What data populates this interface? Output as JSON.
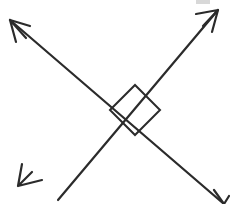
{
  "figure": {
    "title": "Two intersecting perpendicular lines with right angle marker",
    "canvas": {
      "width": 230,
      "height": 204,
      "background": "#ffffff"
    },
    "style": {
      "stroke_color": "#2b2b2b",
      "stroke_width": 2.2,
      "marker_stroke_width": 2.0,
      "artifact_color": "#d8d8d8"
    },
    "intersection": {
      "x": 110,
      "y": 110,
      "label": "intersection-point"
    },
    "lines": [
      {
        "name": "line-ascending",
        "description": "Line running from lower-left to upper-right",
        "from": {
          "x": 58,
          "y": 200
        },
        "to": {
          "x": 218,
          "y": 10
        },
        "arrow_start": false,
        "arrow_end": true
      },
      {
        "name": "line-descending",
        "description": "Line running from upper-left to lower-right",
        "from": {
          "x": 10,
          "y": 20
        },
        "to": {
          "x": 224,
          "y": 204
        },
        "arrow_start": true,
        "arrow_end": true,
        "end_clipped": true
      }
    ],
    "arrowheads": [
      {
        "name": "arrowhead-top-left",
        "tip": {
          "x": 10,
          "y": 20
        },
        "barbs": [
          {
            "x": 30,
            "y": 26
          },
          {
            "x": 16,
            "y": 42
          },
          {
            "x": 26,
            "y": 38
          }
        ]
      },
      {
        "name": "arrowhead-top-right",
        "tip": {
          "x": 218,
          "y": 10
        },
        "barbs": [
          {
            "x": 196,
            "y": 14
          },
          {
            "x": 212,
            "y": 32
          },
          {
            "x": 203,
            "y": 26
          }
        ]
      },
      {
        "name": "arrowhead-bottom-left",
        "tip": {
          "x": 18,
          "y": 186
        },
        "barbs": [
          {
            "x": 22,
            "y": 164
          },
          {
            "x": 42,
            "y": 180
          },
          {
            "x": 32,
            "y": 172
          }
        ]
      },
      {
        "name": "arrowhead-bottom-right-clipped",
        "tip": {
          "x": 224,
          "y": 204
        },
        "barbs": [
          {
            "x": 214,
            "y": 190
          },
          {
            "x": 229,
            "y": 196
          }
        ]
      }
    ],
    "right_angle_marker": {
      "name": "right-angle-square",
      "description": "Square marker indicating 90 degree angle at the intersection",
      "measure_degrees": 90,
      "vertices": [
        {
          "x": 110,
          "y": 110
        },
        {
          "x": 135,
          "y": 85
        },
        {
          "x": 160,
          "y": 110
        },
        {
          "x": 135,
          "y": 135
        }
      ]
    },
    "artifacts": [
      {
        "name": "scan-smudge-top",
        "x": 196,
        "y": 0,
        "width": 14,
        "height": 4
      }
    ]
  }
}
